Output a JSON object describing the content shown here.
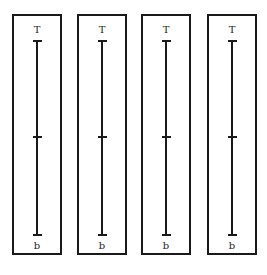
{
  "panels": [
    {
      "top_label": "T",
      "bottom_label": "b"
    },
    {
      "top_label": "T",
      "bottom_label": "b"
    },
    {
      "top_label": "T",
      "bottom_label": "b"
    },
    {
      "top_label": "T",
      "bottom_label": "b"
    }
  ],
  "colors": {
    "stroke": "#1a1a1a",
    "background": "#ffffff"
  }
}
